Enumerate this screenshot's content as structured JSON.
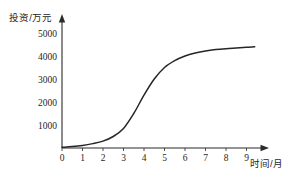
{
  "chart_data": {
    "type": "line",
    "title": "",
    "subtitle": "",
    "xlabel": "时间/月",
    "ylabel": "投资/万元",
    "grid": false,
    "legend": null,
    "legend_position": "none",
    "xlim": [
      0,
      9.8
    ],
    "ylim": [
      0,
      5400
    ],
    "xticks": [
      0,
      1,
      2,
      3,
      4,
      5,
      6,
      7,
      8,
      9
    ],
    "xtick_labels": [
      "0",
      "1",
      "2",
      "3",
      "4",
      "5",
      "6",
      "7",
      "8",
      "9"
    ],
    "yticks": [
      1000,
      2000,
      3000,
      4000,
      5000
    ],
    "ytick_labels": [
      "1000",
      "2000",
      "3000",
      "4000",
      "5000"
    ],
    "series": [
      {
        "name": "投资",
        "x": [
          0,
          0.5,
          1,
          1.5,
          2,
          2.5,
          3,
          3.5,
          4,
          4.5,
          5,
          5.5,
          6,
          6.5,
          7,
          7.5,
          8,
          8.5,
          9,
          9.4
        ],
        "values": [
          30,
          60,
          110,
          190,
          300,
          500,
          850,
          1500,
          2300,
          3000,
          3500,
          3800,
          4000,
          4130,
          4220,
          4280,
          4320,
          4350,
          4380,
          4400
        ]
      }
    ],
    "annotations": [],
    "curve_shape": "logistic-s-curve",
    "plateau_value": 4400,
    "inflection_x": 4
  },
  "axes": {
    "x_arrow": true,
    "y_arrow": true,
    "line_color": "#2b2b2b",
    "curve_color": "#262626"
  }
}
